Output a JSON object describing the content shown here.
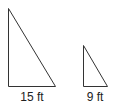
{
  "diagram": {
    "type": "similar-right-triangles",
    "stroke_color": "#333333",
    "large_triangle": {
      "base_label": "15 ft"
    },
    "small_triangle": {
      "base_label": "9 ft"
    }
  }
}
